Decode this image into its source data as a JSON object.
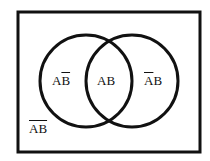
{
  "diagram": {
    "type": "venn",
    "sets": [
      "A",
      "B"
    ],
    "regions": [
      {
        "id": "a-not-b",
        "label_plain": "A",
        "label_over": "B",
        "description": "A and not B"
      },
      {
        "id": "a-and-b",
        "label": "AB",
        "description": "A and B"
      },
      {
        "id": "not-a-b",
        "label_over": "A",
        "label_plain": "B",
        "description": "not A and B"
      },
      {
        "id": "not-a-not-b",
        "label_over": "AB",
        "description": "neither A nor B"
      }
    ],
    "colors": {
      "stroke": "#111111",
      "background": "#ffffff"
    }
  }
}
